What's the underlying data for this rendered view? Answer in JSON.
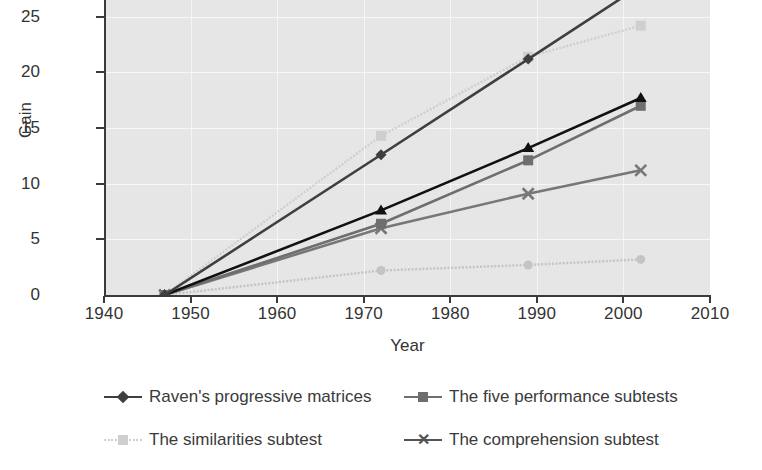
{
  "chart_data": {
    "type": "line",
    "title": "",
    "xlabel": "Year",
    "ylabel": "Gain",
    "xlim": [
      1940,
      2010
    ],
    "ylim": [
      0,
      27.5
    ],
    "xticks": [
      1940,
      1950,
      1960,
      1970,
      1980,
      1990,
      2000,
      2010
    ],
    "yticks": [
      0,
      5,
      10,
      15,
      20,
      25
    ],
    "grid": true,
    "legend_position": "bottom",
    "x": [
      1947,
      1972,
      1989,
      2002
    ],
    "series": [
      {
        "name": "Raven's progressive matrices",
        "values": [
          0,
          12.6,
          21.2,
          27.8
        ],
        "color": "#3f3f3f",
        "marker": "diamond",
        "style": "solid"
      },
      {
        "name": "The five performance subtests",
        "values": [
          0,
          6.4,
          12.1,
          17.0
        ],
        "color": "#6e6e6e",
        "marker": "square",
        "style": "solid"
      },
      {
        "name": "The similarities subtest",
        "values": [
          0,
          14.3,
          21.4,
          24.2
        ],
        "color": "#cfcfcf",
        "marker": "square",
        "style": "dotted"
      },
      {
        "name": "The comprehension subtest",
        "values": [
          0,
          6.0,
          9.1,
          11.2
        ],
        "color": "#777777",
        "marker": "x",
        "style": "solid"
      },
      {
        "name": "unlabelled-dark-triangle-series",
        "values": [
          0,
          7.6,
          13.2,
          17.7
        ],
        "color": "#111111",
        "marker": "triangle",
        "style": "solid"
      },
      {
        "name": "unlabelled-light-circle-series",
        "values": [
          0,
          2.2,
          2.7,
          3.2
        ],
        "color": "#c4c4c4",
        "marker": "circle",
        "style": "dotted"
      }
    ]
  },
  "axes": {
    "x_title": "Year",
    "y_title": "Gain",
    "x_tick_labels": [
      "1940",
      "1950",
      "1960",
      "1970",
      "1980",
      "1990",
      "2000",
      "2010"
    ],
    "y_tick_labels": [
      "0",
      "5",
      "10",
      "15",
      "20",
      "25"
    ]
  },
  "legend": {
    "entries": [
      {
        "label": "Raven's progressive matrices",
        "marker": "diamond",
        "color": "#3f3f3f",
        "style": "solid"
      },
      {
        "label": "The five performance subtests",
        "marker": "square",
        "color": "#6e6e6e",
        "style": "solid"
      },
      {
        "label": "The similarities subtest",
        "marker": "square",
        "color": "#cfcfcf",
        "style": "dotted"
      },
      {
        "label": "The comprehension subtest",
        "marker": "x",
        "color": "#555555",
        "style": "solid"
      }
    ]
  },
  "colors": {
    "plot_background": "#e6e6e6",
    "gridline": "#f7f7f7",
    "axis": "#3a3a3a",
    "text": "#333333",
    "page_background": "#ffffff"
  }
}
